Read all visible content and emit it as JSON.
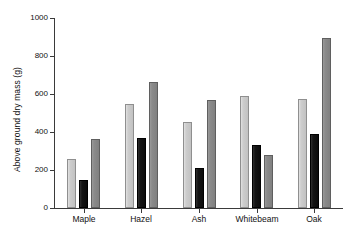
{
  "chart_data": {
    "type": "bar",
    "title": "",
    "subtitle": "",
    "xlabel": "",
    "ylabel": "Above ground dry mass (g)",
    "categories": [
      "Maple",
      "Hazel",
      "Ash",
      "Whitebeam",
      "Oak"
    ],
    "series": [
      {
        "name": "series-1",
        "color": "#cdcdcd",
        "values": [
          260,
          550,
          455,
          590,
          575
        ]
      },
      {
        "name": "series-2",
        "color": "#121212",
        "values": [
          150,
          370,
          210,
          330,
          390
        ]
      },
      {
        "name": "series-3",
        "color": "#8a8a8a",
        "values": [
          365,
          665,
          570,
          280,
          895
        ]
      }
    ],
    "ylim": [
      0,
      1000
    ],
    "yticks": [
      0,
      200,
      400,
      600,
      800,
      1000
    ],
    "ytick_labels": [
      "0",
      "200",
      "400",
      "600",
      "800",
      "1000"
    ],
    "grid": false,
    "legend": "none"
  },
  "axis": {
    "y_title": "Above ground dry mass (g)",
    "tick_color": "#3a3a3a"
  }
}
